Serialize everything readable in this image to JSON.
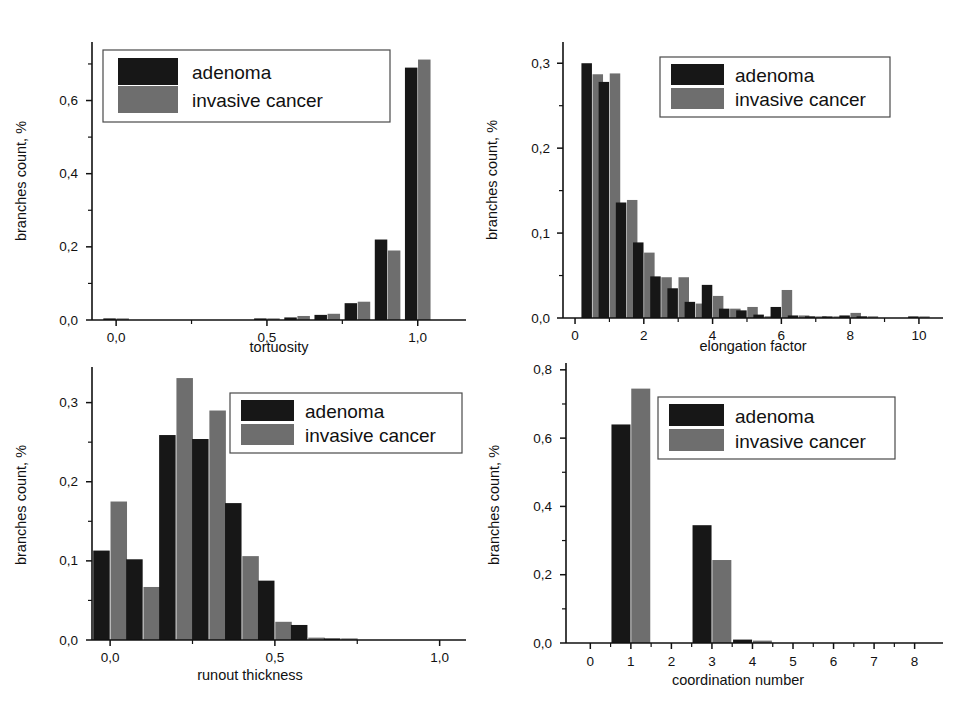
{
  "figure": {
    "background": "#ffffff",
    "series_colors": {
      "adenoma": "#171717",
      "invasive_cancer": "#6e6e6e"
    },
    "legend": {
      "adenoma": "adenoma",
      "invasive_cancer": "invasive cancer"
    },
    "shared_ylabel": "branches count, %"
  },
  "panels": {
    "top_left": {
      "xlabel": "tortuosity",
      "ylabel": "branches count, %"
    },
    "top_right": {
      "xlabel": "elongation factor",
      "ylabel": "branches count, %"
    },
    "bottom_left": {
      "xlabel": "runout thickness",
      "ylabel": "branches count, %"
    },
    "bottom_right": {
      "xlabel": "coordination number",
      "ylabel": "branches count, %"
    }
  },
  "chart_data": [
    {
      "id": "tortuosity",
      "type": "bar",
      "title": "",
      "xlabel": "tortuosity",
      "ylabel": "branches count, %",
      "xlim": [
        -0.08,
        1.16
      ],
      "ylim": [
        0.0,
        0.76
      ],
      "xticks": [
        0.0,
        0.5,
        1.0
      ],
      "xticklabels": [
        "0,0",
        "0,5",
        "1,0"
      ],
      "xminorticks": [
        0.25,
        0.75
      ],
      "yticks": [
        0.0,
        0.2,
        0.4,
        0.6
      ],
      "yticklabels": [
        "0,0",
        "0,2",
        "0,4",
        "0,6"
      ],
      "yminorticks": [
        0.1,
        0.3,
        0.5,
        0.7
      ],
      "grid": false,
      "legend_position": "upper-left",
      "x": [
        0.0,
        0.1,
        0.2,
        0.3,
        0.4,
        0.5,
        0.6,
        0.7,
        0.8,
        0.9,
        1.0
      ],
      "series": [
        {
          "name": "adenoma",
          "values": [
            0.004,
            0.0,
            0.0,
            0.0,
            0.0,
            0.002,
            0.007,
            0.014,
            0.046,
            0.22,
            0.69
          ]
        },
        {
          "name": "invasive cancer",
          "values": [
            0.004,
            0.0,
            0.0,
            0.0,
            0.0,
            0.002,
            0.011,
            0.017,
            0.05,
            0.19,
            0.712
          ]
        }
      ]
    },
    {
      "id": "elongation_factor",
      "type": "bar",
      "title": "",
      "xlabel": "elongation factor",
      "ylabel": "branches count, %",
      "xlim": [
        -0.35,
        10.7
      ],
      "ylim": [
        0.0,
        0.325
      ],
      "xticks": [
        0,
        2,
        4,
        6,
        8,
        10
      ],
      "xticklabels": [
        "0",
        "2",
        "4",
        "6",
        "8",
        "10"
      ],
      "xminorticks": [
        1,
        3,
        5,
        7,
        9
      ],
      "yticks": [
        0.0,
        0.1,
        0.2,
        0.3
      ],
      "yticklabels": [
        "0,0",
        "0,1",
        "0,2",
        "0,3"
      ],
      "yminorticks": [
        0.05,
        0.15,
        0.25
      ],
      "grid": false,
      "legend_position": "upper-right",
      "x": [
        0.5,
        1.0,
        1.5,
        2.0,
        2.5,
        3.0,
        3.5,
        4.0,
        4.5,
        5.0,
        5.5,
        6.0,
        6.5,
        7.0,
        7.5,
        8.0,
        8.5,
        9.0,
        9.5,
        10.0
      ],
      "series": [
        {
          "name": "adenoma",
          "values": [
            0.3,
            0.278,
            0.136,
            0.089,
            0.049,
            0.035,
            0.019,
            0.039,
            0.011,
            0.009,
            0.004,
            0.013,
            0.003,
            0.002,
            0.001,
            0.003,
            0.002,
            0.0,
            0.0,
            0.001
          ]
        },
        {
          "name": "invasive cancer",
          "values": [
            0.287,
            0.288,
            0.139,
            0.077,
            0.048,
            0.048,
            0.017,
            0.026,
            0.011,
            0.013,
            0.002,
            0.033,
            0.003,
            0.001,
            0.001,
            0.006,
            0.002,
            0.0,
            0.0,
            0.001
          ]
        }
      ]
    },
    {
      "id": "runout_thickness",
      "type": "bar",
      "title": "",
      "xlabel": "runout thickness",
      "ylabel": "branches count, %",
      "xlim": [
        -0.055,
        1.08
      ],
      "ylim": [
        0.0,
        0.345
      ],
      "xticks": [
        0.0,
        0.5,
        1.0
      ],
      "xticklabels": [
        "0,0",
        "0,5",
        "1,0"
      ],
      "xminorticks": [
        0.25,
        0.75
      ],
      "yticks": [
        0.0,
        0.1,
        0.2,
        0.3
      ],
      "yticklabels": [
        "0,0",
        "0,1",
        "0,2",
        "0,3"
      ],
      "yminorticks": [
        0.05,
        0.15,
        0.25
      ],
      "grid": false,
      "legend_position": "upper-right",
      "x": [
        0.0,
        0.1,
        0.2,
        0.3,
        0.4,
        0.5,
        0.6,
        0.7
      ],
      "series": [
        {
          "name": "adenoma",
          "values": [
            0.113,
            0.102,
            0.259,
            0.254,
            0.173,
            0.075,
            0.019,
            0.002
          ]
        },
        {
          "name": "invasive cancer",
          "values": [
            0.175,
            0.067,
            0.331,
            0.29,
            0.106,
            0.023,
            0.003,
            0.001
          ]
        }
      ]
    },
    {
      "id": "coordination_number",
      "type": "bar",
      "title": "",
      "xlabel": "coordination number",
      "ylabel": "branches count, %",
      "xlim": [
        -0.6,
        8.7
      ],
      "ylim": [
        0.0,
        0.82
      ],
      "xticks": [
        0,
        1,
        2,
        3,
        4,
        5,
        6,
        7,
        8
      ],
      "xticklabels": [
        "0",
        "1",
        "2",
        "3",
        "4",
        "5",
        "6",
        "7",
        "8"
      ],
      "xminorticks": [
        0.5,
        1.5,
        2.5,
        3.5,
        4.5,
        5.5,
        6.5,
        7.5
      ],
      "yticks": [
        0.0,
        0.2,
        0.4,
        0.6,
        0.8
      ],
      "yticklabels": [
        "0,0",
        "0,2",
        "0,4",
        "0,6",
        "0,8"
      ],
      "yminorticks": [
        0.1,
        0.3,
        0.5,
        0.7
      ],
      "grid": false,
      "legend_position": "upper-right",
      "x": [
        0,
        1,
        2,
        3,
        4,
        5,
        6,
        7,
        8
      ],
      "series": [
        {
          "name": "adenoma",
          "values": [
            0.0,
            0.64,
            0.0,
            0.345,
            0.01,
            0.0,
            0.0,
            0.0,
            0.0
          ]
        },
        {
          "name": "invasive cancer",
          "values": [
            0.0,
            0.745,
            0.0,
            0.243,
            0.007,
            0.0,
            0.0,
            0.0,
            0.0
          ]
        }
      ]
    }
  ]
}
